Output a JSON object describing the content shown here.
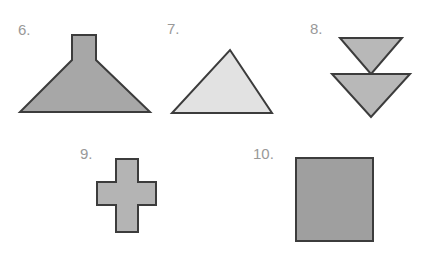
{
  "page": {
    "background_color": "#ffffff",
    "width": 442,
    "height": 267
  },
  "label_color": "#999999",
  "items": [
    {
      "number": "6.",
      "shape_name": "funnel-lamp-shape",
      "shape_type": "polygon",
      "fill": "#a7a7a7",
      "stroke": "#3c3c3c",
      "stroke_width": 2,
      "label_x": 18,
      "label_y": 22,
      "svg_x": 14,
      "svg_y": 30,
      "svg_w": 142,
      "svg_h": 88,
      "points": "58,5 82,5 82,30 136,82 6,82 58,30"
    },
    {
      "number": "7.",
      "shape_name": "triangle-shape",
      "shape_type": "polygon",
      "fill": "#e2e2e2",
      "stroke": "#3c3c3c",
      "stroke_width": 2,
      "label_x": 167,
      "label_y": 21,
      "svg_x": 166,
      "svg_y": 45,
      "svg_w": 112,
      "svg_h": 74,
      "points": "64,5 106,68 6,68"
    },
    {
      "number": "8.",
      "shape_name": "double-chevron-down-arrow-shape",
      "shape_type": "polygon",
      "fill": "#b8b8b8",
      "stroke": "#3c3c3c",
      "stroke_width": 2,
      "label_x": 310,
      "label_y": 21,
      "svg_x": 314,
      "svg_y": 33,
      "svg_w": 102,
      "svg_h": 90,
      "points": "26,5 88,5 57,41 96,41 57,84 18,41 57,41"
    },
    {
      "number": "9.",
      "shape_name": "plus-cross-shape",
      "shape_type": "polygon",
      "fill": "#b4b4b4",
      "stroke": "#3c3c3c",
      "stroke_width": 2,
      "label_x": 80,
      "label_y": 146,
      "svg_x": 92,
      "svg_y": 154,
      "svg_w": 70,
      "svg_h": 84,
      "points": "24,5 46,5 46,28 64,28 64,51 46,51 46,78 24,78 24,51 5,51 5,28 24,28"
    },
    {
      "number": "10.",
      "shape_name": "square-shape",
      "shape_type": "polygon",
      "fill": "#9f9f9f",
      "stroke": "#3c3c3c",
      "stroke_width": 2,
      "label_x": 253,
      "label_y": 146,
      "svg_x": 291,
      "svg_y": 153,
      "svg_w": 88,
      "svg_h": 94,
      "points": "5,5 82,5 82,88 5,88"
    }
  ]
}
